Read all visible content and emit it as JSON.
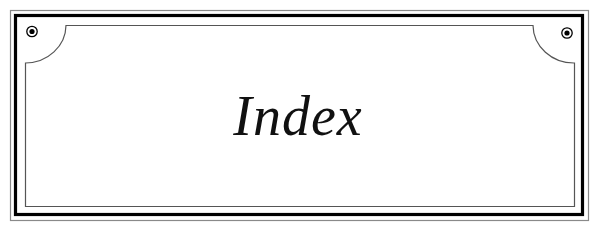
{
  "plaque": {
    "title": "Index",
    "colors": {
      "outer_line": "#8a8a8a",
      "thick_line": "#000000",
      "inner_line": "#555555",
      "text": "#111111",
      "background": "#ffffff"
    },
    "ornaments": {
      "left_screw": "screw-head-icon",
      "right_screw": "screw-head-icon"
    }
  }
}
